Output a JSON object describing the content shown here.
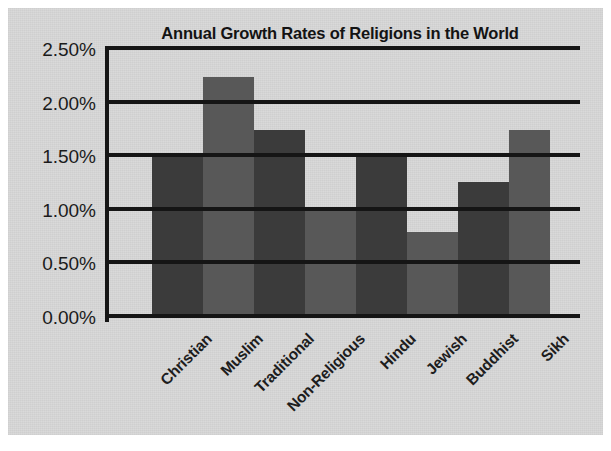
{
  "figure": {
    "background_color": "#d8d8d8",
    "page_color": "#ffffff"
  },
  "chart_data": {
    "type": "bar",
    "title": "Annual Growth Rates of Religions in the World",
    "xlabel": "",
    "ylabel": "",
    "categories": [
      "Christian",
      "Muslim",
      "Traditional",
      "Non-Religious",
      "Hindu",
      "Jewish",
      "Buddhist",
      "Sikh"
    ],
    "values": [
      1.5,
      2.25,
      1.75,
      1.02,
      1.5,
      0.8,
      1.27,
      1.75
    ],
    "value_labels": [
      "1.50%",
      "2.25%",
      "1.75%",
      "1.02%",
      "1.50%",
      "0.80%",
      "1.27%",
      "1.75%"
    ],
    "ylim": [
      0.0,
      2.5
    ],
    "ytick_labels": [
      "2.50%",
      "2.00%",
      "1.50%",
      "1.00%",
      "0.50%",
      "0.00%"
    ],
    "ytick_values": [
      2.5,
      2.0,
      1.5,
      1.0,
      0.5,
      0.0
    ],
    "grid": true,
    "grid_axis": "y",
    "legend": false,
    "bar_colors": [
      "#3b3b3b",
      "#585858",
      "#3b3b3b",
      "#585858",
      "#3b3b3b",
      "#585858",
      "#3b3b3b",
      "#585858"
    ],
    "bar_gap": 0,
    "axis_color": "#151515",
    "units": "percent per year"
  }
}
